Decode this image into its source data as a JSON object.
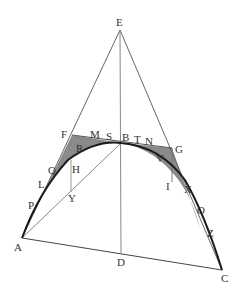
{
  "diagram": {
    "type": "geometry-figure",
    "colors": {
      "line": "#555555",
      "curve": "#1a1a1a",
      "shade": "#8a8a8a",
      "label": "#333333"
    },
    "labels": {
      "E": "E",
      "F": "F",
      "M": "M",
      "S": "S",
      "B": "B",
      "T": "T",
      "N": "N",
      "G": "G",
      "R": "R",
      "V": "V",
      "Q": "Q",
      "H": "H",
      "L": "L",
      "I": "I",
      "X": "X",
      "P": "P",
      "Y": "Y",
      "O": "O",
      "Z": "Z",
      "A": "A",
      "D": "D",
      "C": "C"
    }
  }
}
